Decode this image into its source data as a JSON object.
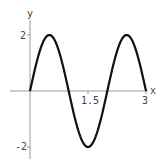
{
  "chart_data": {
    "type": "line",
    "title": "",
    "xlabel": "x",
    "ylabel": "y",
    "xlim": [
      0,
      3
    ],
    "ylim": [
      -2,
      2
    ],
    "x_ticks": [
      {
        "value": 1.5,
        "label": "1.5"
      },
      {
        "value": 3,
        "label": "3"
      }
    ],
    "y_ticks": [
      {
        "value": 2,
        "label": "2"
      },
      {
        "value": -2,
        "label": "-2"
      }
    ],
    "grid": false,
    "legend": null,
    "function": "y = 2 sin(pi x)",
    "series": [
      {
        "name": "y",
        "x": [
          0,
          0.25,
          0.5,
          0.75,
          1.0,
          1.25,
          1.5,
          1.75,
          2.0,
          2.25,
          2.5,
          2.75,
          3.0
        ],
        "values": [
          0,
          1.41,
          2,
          1.41,
          0,
          -1.41,
          -2,
          -1.41,
          0,
          1.41,
          2,
          1.41,
          0
        ]
      }
    ]
  },
  "axes": {
    "x_label": "x",
    "y_label": "y",
    "x_tick_1": "1.5",
    "x_tick_2": "3",
    "y_tick_top": "2",
    "y_tick_bottom": "-2"
  },
  "colors": {
    "curve": "#111111",
    "axis": "#888888"
  }
}
